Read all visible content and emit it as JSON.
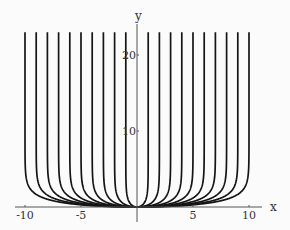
{
  "chart_data": {
    "type": "line",
    "title": "",
    "xlabel": "x",
    "ylabel": "y",
    "xlim": [
      -10.5,
      10.5
    ],
    "ylim": [
      0,
      23
    ],
    "grid": false,
    "legend": null,
    "x_ticks": [
      -10,
      -5,
      5,
      10
    ],
    "x_tick_labels": [
      "-10",
      "-5",
      "5",
      "10"
    ],
    "y_ticks": [
      10,
      20
    ],
    "y_tick_labels": [
      "10",
      "20"
    ],
    "series": [
      {
        "name": "a=-10",
        "asymptote": -10
      },
      {
        "name": "a=-9",
        "asymptote": -9
      },
      {
        "name": "a=-8",
        "asymptote": -8
      },
      {
        "name": "a=-7",
        "asymptote": -7
      },
      {
        "name": "a=-6",
        "asymptote": -6
      },
      {
        "name": "a=-5",
        "asymptote": -5
      },
      {
        "name": "a=-4",
        "asymptote": -4
      },
      {
        "name": "a=-3",
        "asymptote": -3
      },
      {
        "name": "a=-2",
        "asymptote": -2
      },
      {
        "name": "a=-1",
        "asymptote": -1
      },
      {
        "name": "a=1",
        "asymptote": 1
      },
      {
        "name": "a=2",
        "asymptote": 2
      },
      {
        "name": "a=3",
        "asymptote": 3
      },
      {
        "name": "a=4",
        "asymptote": 4
      },
      {
        "name": "a=5",
        "asymptote": 5
      },
      {
        "name": "a=6",
        "asymptote": 6
      },
      {
        "name": "a=7",
        "asymptote": 7
      },
      {
        "name": "a=8",
        "asymptote": 8
      },
      {
        "name": "a=9",
        "asymptote": 9
      },
      {
        "name": "a=10",
        "asymptote": 10
      }
    ],
    "sample_points_a10": [
      {
        "x": 0,
        "y": 0
      },
      {
        "x": 5,
        "y": 0.29
      },
      {
        "x": 8,
        "y": 1.02
      },
      {
        "x": 9,
        "y": 1.66
      },
      {
        "x": 9.6,
        "y": 2.54
      },
      {
        "x": 9.99,
        "y": 6.2
      }
    ]
  },
  "colors": {
    "curve": "#151515",
    "axis": "#555555",
    "background": "#fbfbfb"
  }
}
